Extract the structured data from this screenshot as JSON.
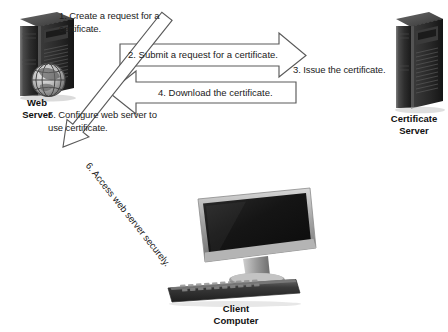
{
  "diagram": {
    "background_color": "#ffffff",
    "line_color": "#555555"
  },
  "devices": [
    {
      "id": "web-server",
      "label": "Web\nServer",
      "icon": "tower-server-with-globe-icon"
    },
    {
      "id": "certificate-server",
      "label": "Certificate\nServer",
      "icon": "tower-server-icon"
    },
    {
      "id": "client-computer",
      "label": "Client\nComputer",
      "icon": "desktop-monitor-keyboard-icon"
    }
  ],
  "steps": [
    {
      "number": "1",
      "text": "1. Create a request for a\n    certificate.",
      "style": "plain-text",
      "near": "web-server"
    },
    {
      "number": "2",
      "text": "2. Submit a request for a certificate.",
      "style": "block-arrow-right",
      "from": "web-server",
      "to": "certificate-server"
    },
    {
      "number": "3",
      "text": "3. Issue the certificate.",
      "style": "plain-text",
      "near": "certificate-server"
    },
    {
      "number": "4",
      "text": "4. Download the certificate.",
      "style": "block-arrow-left",
      "from": "certificate-server",
      "to": "web-server"
    },
    {
      "number": "5",
      "text": "5. Configure web server to\n    use certificate.",
      "style": "plain-text",
      "near": "web-server"
    },
    {
      "number": "6",
      "text": "6. Access web server securely.",
      "style": "block-arrow-diagonal-up-left",
      "from": "client-computer",
      "to": "web-server",
      "rotation_deg": -51
    }
  ]
}
